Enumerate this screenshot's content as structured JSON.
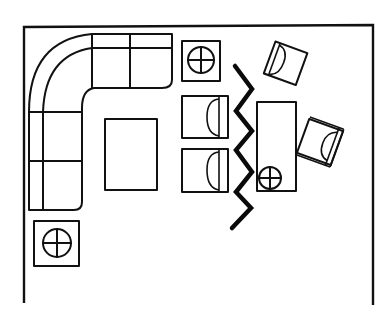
{
  "diagram": {
    "type": "floor-plan-sketch",
    "colors": {
      "ink": "#111111",
      "background": "#ffffff"
    },
    "labels": {
      "walls": "Room walls",
      "sofa": "L-shaped sectional sofa",
      "coffee_table": "Coffee table",
      "end_table_top": "End table with lamp",
      "end_table_bottom": "End table with lamp",
      "armchair_1": "Armchair",
      "armchair_2": "Armchair",
      "divider": "Folding screen divider",
      "desk": "Desk with lamp",
      "chair_top": "Lounge chair",
      "desk_chair": "Desk chair"
    },
    "elements": [
      {
        "id": "walls",
        "icon": "wall-outline"
      },
      {
        "id": "sofa",
        "icon": "sectional-sofa",
        "seat_count": 5
      },
      {
        "id": "coffee_table",
        "icon": "rectangle"
      },
      {
        "id": "end_table_top",
        "icon": "lamp-table"
      },
      {
        "id": "end_table_bottom",
        "icon": "lamp-table"
      },
      {
        "id": "armchair_1",
        "icon": "armchair"
      },
      {
        "id": "armchair_2",
        "icon": "armchair"
      },
      {
        "id": "divider",
        "icon": "zigzag-screen"
      },
      {
        "id": "desk",
        "icon": "desk-with-lamp"
      },
      {
        "id": "chair_top",
        "icon": "armchair-rotated"
      },
      {
        "id": "desk_chair",
        "icon": "armchair-rotated"
      }
    ]
  }
}
